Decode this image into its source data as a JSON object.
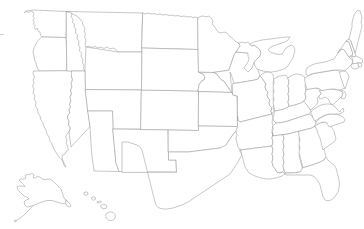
{
  "map": {
    "title": "United States Blank Outline Map",
    "type": "choropleth-blank",
    "projection": "albers-usa",
    "background_color": "#ffffff",
    "border_color": "#9a9a9a",
    "fill_color": "#ffffff",
    "border_width_px": 0.55,
    "labels_visible": false,
    "legend_visible": false,
    "graticule_visible": false,
    "region_count": 51,
    "insets": [
      {
        "name": "alaska",
        "label": "",
        "position": "lower-left"
      },
      {
        "name": "hawaii",
        "label": "",
        "position": "lower-left-center"
      }
    ],
    "regions": [
      {
        "code": "WA",
        "name": "Washington"
      },
      {
        "code": "OR",
        "name": "Oregon"
      },
      {
        "code": "CA",
        "name": "California"
      },
      {
        "code": "NV",
        "name": "Nevada"
      },
      {
        "code": "ID",
        "name": "Idaho"
      },
      {
        "code": "MT",
        "name": "Montana"
      },
      {
        "code": "WY",
        "name": "Wyoming"
      },
      {
        "code": "UT",
        "name": "Utah"
      },
      {
        "code": "AZ",
        "name": "Arizona"
      },
      {
        "code": "CO",
        "name": "Colorado"
      },
      {
        "code": "NM",
        "name": "New Mexico"
      },
      {
        "code": "ND",
        "name": "North Dakota"
      },
      {
        "code": "SD",
        "name": "South Dakota"
      },
      {
        "code": "NE",
        "name": "Nebraska"
      },
      {
        "code": "KS",
        "name": "Kansas"
      },
      {
        "code": "OK",
        "name": "Oklahoma"
      },
      {
        "code": "TX",
        "name": "Texas"
      },
      {
        "code": "MN",
        "name": "Minnesota"
      },
      {
        "code": "IA",
        "name": "Iowa"
      },
      {
        "code": "MO",
        "name": "Missouri"
      },
      {
        "code": "AR",
        "name": "Arkansas"
      },
      {
        "code": "LA",
        "name": "Louisiana"
      },
      {
        "code": "WI",
        "name": "Wisconsin"
      },
      {
        "code": "IL",
        "name": "Illinois"
      },
      {
        "code": "MI",
        "name": "Michigan"
      },
      {
        "code": "IN",
        "name": "Indiana"
      },
      {
        "code": "OH",
        "name": "Ohio"
      },
      {
        "code": "KY",
        "name": "Kentucky"
      },
      {
        "code": "TN",
        "name": "Tennessee"
      },
      {
        "code": "MS",
        "name": "Mississippi"
      },
      {
        "code": "AL",
        "name": "Alabama"
      },
      {
        "code": "GA",
        "name": "Georgia"
      },
      {
        "code": "FL",
        "name": "Florida"
      },
      {
        "code": "SC",
        "name": "South Carolina"
      },
      {
        "code": "NC",
        "name": "North Carolina"
      },
      {
        "code": "VA",
        "name": "Virginia"
      },
      {
        "code": "WV",
        "name": "West Virginia"
      },
      {
        "code": "MD",
        "name": "Maryland"
      },
      {
        "code": "DE",
        "name": "Delaware"
      },
      {
        "code": "PA",
        "name": "Pennsylvania"
      },
      {
        "code": "NJ",
        "name": "New Jersey"
      },
      {
        "code": "NY",
        "name": "New York"
      },
      {
        "code": "CT",
        "name": "Connecticut"
      },
      {
        "code": "RI",
        "name": "Rhode Island"
      },
      {
        "code": "MA",
        "name": "Massachusetts"
      },
      {
        "code": "VT",
        "name": "Vermont"
      },
      {
        "code": "NH",
        "name": "New Hampshire"
      },
      {
        "code": "ME",
        "name": "Maine"
      },
      {
        "code": "AK",
        "name": "Alaska"
      },
      {
        "code": "HI",
        "name": "Hawaii"
      }
    ]
  }
}
